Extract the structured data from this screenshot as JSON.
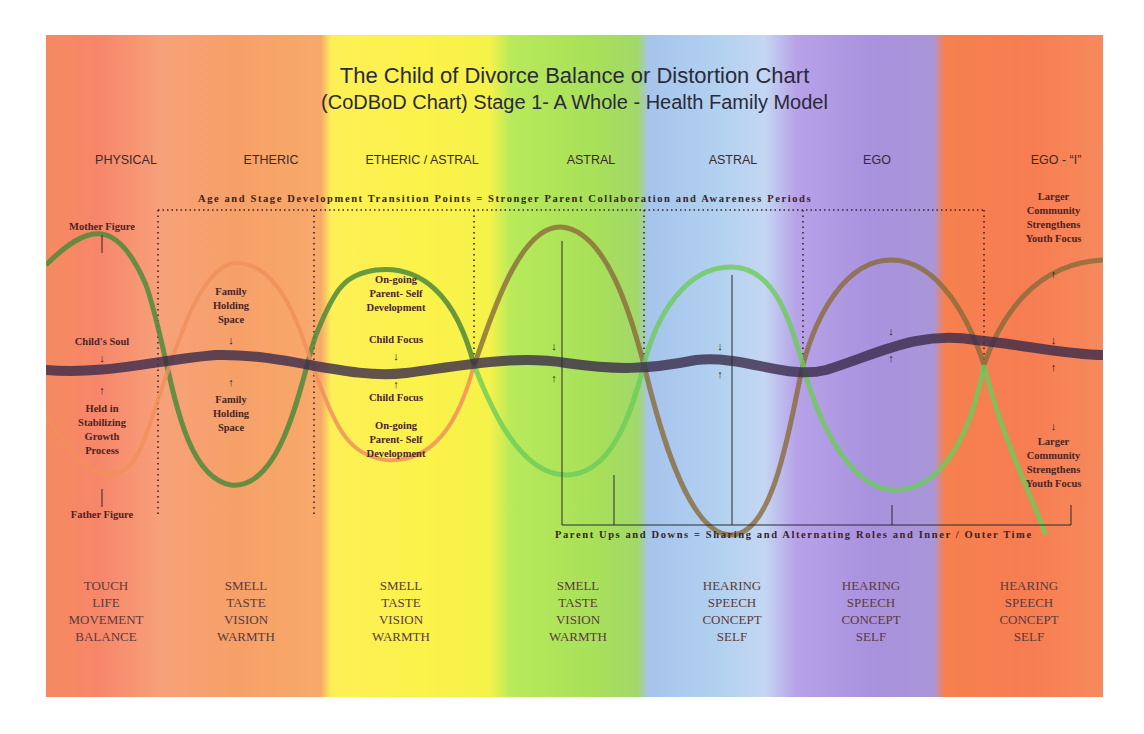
{
  "title": {
    "line1": "The Child of Divorce Balance or Distortion Chart",
    "line2": "(CoDBoD Chart) Stage 1-  A Whole - Health Family Model"
  },
  "stages": [
    {
      "label": "PHYSICAL",
      "color": "#f58a5f"
    },
    {
      "label": "ETHERIC",
      "color": "#f6a068"
    },
    {
      "label": "ETHERIC / ASTRAL",
      "color": "#fbf24a"
    },
    {
      "label": "ASTRAL",
      "color": "#a8e05a"
    },
    {
      "label": "ASTRAL",
      "color": "#b3d2f0"
    },
    {
      "label": "EGO",
      "color": "#a992de"
    },
    {
      "label": "EGO - “I”",
      "color": "#f77d52"
    }
  ],
  "banners": {
    "top": "Age and Stage Development Transition Points =  Stronger Parent Collaboration and Awareness Periods",
    "bottom": "Parent Ups and Downs = Sharing and Alternating Roles and Inner / Outer Time"
  },
  "annotations": {
    "mother_figure": "Mother Figure",
    "father_figure": "Father Figure",
    "childs_soul": "Child's Soul",
    "held_in": [
      "Held in",
      "Stabilizing",
      "Growth",
      "Process"
    ],
    "family_holding_top": [
      "Family",
      "Holding",
      "Space"
    ],
    "family_holding_bottom": [
      "Family",
      "Holding",
      "Space"
    ],
    "ongoing_top": [
      "On-going",
      "Parent- Self",
      "Development"
    ],
    "child_focus_top": "Child Focus",
    "child_focus_bottom": "Child Focus",
    "ongoing_bottom": [
      "On-going",
      "Parent- Self",
      "Development"
    ],
    "community_top": [
      "Larger",
      "Community",
      "Strengthens",
      "Youth Focus"
    ],
    "community_bottom": [
      "Larger",
      "Community",
      "Strengthens",
      "Youth Focus"
    ]
  },
  "senses": [
    [
      "TOUCH",
      "LIFE",
      "MOVEMENT",
      "BALANCE"
    ],
    [
      "SMELL",
      "TASTE",
      "VISION",
      "WARMTH"
    ],
    [
      "SMELL",
      "TASTE",
      "VISION",
      "WARMTH"
    ],
    [
      "SMELL",
      "TASTE",
      "VISION",
      "WARMTH"
    ],
    [
      "HEARING",
      "SPEECH",
      "CONCEPT",
      "SELF"
    ],
    [
      "HEARING",
      "SPEECH",
      "CONCEPT",
      "SELF"
    ],
    [
      "HEARING",
      "SPEECH",
      "CONCEPT",
      "SELF"
    ]
  ],
  "glyphs": {
    "down": "↓",
    "up": "↑"
  },
  "colors": {
    "soul_line": "#3a2a4a",
    "wave_green": "#4e8a3a",
    "wave_orange": "#f0905a",
    "wave_brown": "#8a6a3a",
    "wave_lightgreen": "#6ccc5a"
  }
}
